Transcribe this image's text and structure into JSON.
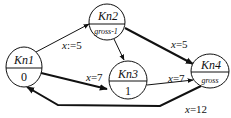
{
  "diagram": {
    "type": "state-transition-graph",
    "nodes": [
      {
        "id": "Kn1",
        "name": "Kn1",
        "sub": "0"
      },
      {
        "id": "Kn2",
        "name": "Kn2",
        "sub": "gross-1"
      },
      {
        "id": "Kn3",
        "name": "Kn3",
        "sub": "1"
      },
      {
        "id": "Kn4",
        "name": "Kn4",
        "sub": "gross"
      }
    ],
    "edges": [
      {
        "from": "Kn1",
        "to": "Kn2",
        "label_var": "x",
        "label_rest": ":=5",
        "weight": "thin"
      },
      {
        "from": "Kn2",
        "to": "Kn3",
        "label_var": "",
        "label_rest": "",
        "weight": "thin"
      },
      {
        "from": "Kn2",
        "to": "Kn4",
        "label_var": "x",
        "label_rest": "=5",
        "weight": "thick"
      },
      {
        "from": "Kn1",
        "to": "Kn3",
        "label_var": "x",
        "label_rest": "=7",
        "weight": "thick"
      },
      {
        "from": "Kn3",
        "to": "Kn4",
        "label_var": "x",
        "label_rest": "=7",
        "weight": "thin"
      },
      {
        "from": "Kn4",
        "to": "Kn1",
        "label_var": "x",
        "label_rest": "=12",
        "weight": "thick"
      }
    ],
    "colors": {
      "stroke": "#111111",
      "background": "#ffffff"
    }
  }
}
